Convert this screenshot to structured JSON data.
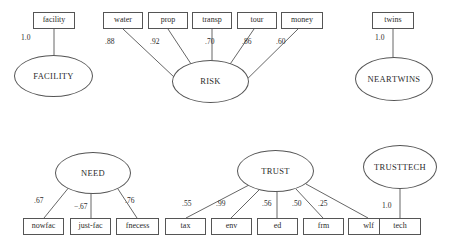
{
  "diagram": {
    "type": "path-diagram",
    "background_color": "#ffffff",
    "stroke_color": "#555555",
    "text_color": "#2b2b2b",
    "models": [
      {
        "id": "facility",
        "latent": {
          "label": "FACILITY",
          "x": 14,
          "y": 55,
          "w": 79,
          "h": 42
        },
        "indicators": [
          {
            "label": "facility",
            "coefficient": "1.0",
            "x": 33,
            "y": 12,
            "w": 42,
            "h": 17,
            "coef_x": 21,
            "coef_y": 33
          }
        ]
      },
      {
        "id": "risk",
        "latent": {
          "label": "RISK",
          "x": 172,
          "y": 60,
          "w": 77,
          "h": 43
        },
        "indicators": [
          {
            "label": "water",
            "coefficient": ".88",
            "x": 103,
            "y": 12,
            "w": 40,
            "h": 17,
            "coef_x": 105,
            "coef_y": 37
          },
          {
            "label": "prop",
            "coefficient": ".92",
            "x": 148,
            "y": 12,
            "w": 40,
            "h": 17,
            "coef_x": 150,
            "coef_y": 37
          },
          {
            "label": "transp",
            "coefficient": ".70",
            "x": 192,
            "y": 12,
            "w": 40,
            "h": 17,
            "coef_x": 205,
            "coef_y": 37
          },
          {
            "label": "tour",
            "coefficient": ".86",
            "x": 237,
            "y": 12,
            "w": 40,
            "h": 17,
            "coef_x": 242,
            "coef_y": 37
          },
          {
            "label": "money",
            "coefficient": ".60",
            "x": 281,
            "y": 12,
            "w": 42,
            "h": 17,
            "coef_x": 276,
            "coef_y": 37
          }
        ]
      },
      {
        "id": "near-twins",
        "latent": {
          "label": "NEAR\nTWINS",
          "x": 355,
          "y": 57,
          "w": 78,
          "h": 44
        },
        "indicators": [
          {
            "label": "twins",
            "coefficient": "1.0",
            "x": 372,
            "y": 12,
            "w": 42,
            "h": 17,
            "coef_x": 375,
            "coef_y": 33
          }
        ]
      },
      {
        "id": "need",
        "latent": {
          "label": "NEED",
          "x": 55,
          "y": 152,
          "w": 76,
          "h": 42
        },
        "indicators": [
          {
            "label": "nowfac",
            "coefficient": ".67",
            "x": 23,
            "y": 218,
            "w": 41,
            "h": 17,
            "coef_x": 34,
            "coef_y": 196
          },
          {
            "label": "just-fac",
            "coefficient": "−.67",
            "x": 70,
            "y": 218,
            "w": 41,
            "h": 17,
            "coef_x": 74,
            "coef_y": 202
          },
          {
            "label": "fnecess",
            "coefficient": ".76",
            "x": 116,
            "y": 218,
            "w": 43,
            "h": 17,
            "coef_x": 125,
            "coef_y": 196
          }
        ]
      },
      {
        "id": "trust",
        "latent": {
          "label": "TRUST",
          "x": 237,
          "y": 150,
          "w": 77,
          "h": 42
        },
        "indicators": [
          {
            "label": "tax",
            "coefficient": ".55",
            "x": 165,
            "y": 218,
            "w": 41,
            "h": 17,
            "coef_x": 182,
            "coef_y": 199
          },
          {
            "label": "env",
            "coefficient": ".99",
            "x": 211,
            "y": 218,
            "w": 41,
            "h": 17,
            "coef_x": 216,
            "coef_y": 199
          },
          {
            "label": "ed",
            "coefficient": ".56",
            "x": 257,
            "y": 218,
            "w": 41,
            "h": 17,
            "coef_x": 262,
            "coef_y": 199
          },
          {
            "label": "frm",
            "coefficient": ".50",
            "x": 303,
            "y": 218,
            "w": 41,
            "h": 17,
            "coef_x": 292,
            "coef_y": 199
          },
          {
            "label": "wlf",
            "coefficient": ".25",
            "x": 348,
            "y": 218,
            "w": 41,
            "h": 17,
            "coef_x": 318,
            "coef_y": 199
          }
        ]
      },
      {
        "id": "trust-tech",
        "latent": {
          "label": "TRUST\nTECH",
          "x": 363,
          "y": 145,
          "w": 74,
          "h": 44
        },
        "indicators": [
          {
            "label": "tech",
            "coefficient": "1.0",
            "x": 379,
            "y": 218,
            "w": 42,
            "h": 17,
            "coef_x": 382,
            "coef_y": 201
          }
        ]
      }
    ],
    "edges": [
      {
        "name": "facility-to-FACILITY",
        "x1": 54,
        "y1": 29,
        "x2": 54,
        "y2": 55
      },
      {
        "name": "water-to-RISK",
        "x1": 123,
        "y1": 29,
        "x2": 191,
        "y2": 93
      },
      {
        "name": "prop-to-RISK",
        "x1": 168,
        "y1": 29,
        "x2": 199,
        "y2": 76
      },
      {
        "name": "transp-to-RISK",
        "x1": 212,
        "y1": 29,
        "x2": 212,
        "y2": 61
      },
      {
        "name": "tour-to-RISK",
        "x1": 254,
        "y1": 29,
        "x2": 222,
        "y2": 76
      },
      {
        "name": "money-to-RISK",
        "x1": 298,
        "y1": 29,
        "x2": 231,
        "y2": 95
      },
      {
        "name": "twins-to-NEARTWINS",
        "x1": 393,
        "y1": 29,
        "x2": 393,
        "y2": 57
      },
      {
        "name": "NEED-to-nowfac",
        "x1": 70,
        "y1": 186,
        "x2": 44,
        "y2": 218
      },
      {
        "name": "NEED-to-just-fac",
        "x1": 91,
        "y1": 194,
        "x2": 91,
        "y2": 218
      },
      {
        "name": "NEED-to-fnecess",
        "x1": 116,
        "y1": 186,
        "x2": 137,
        "y2": 218
      },
      {
        "name": "TRUST-to-tax",
        "x1": 249,
        "y1": 185,
        "x2": 186,
        "y2": 218
      },
      {
        "name": "TRUST-to-env",
        "x1": 259,
        "y1": 190,
        "x2": 231,
        "y2": 218
      },
      {
        "name": "TRUST-to-ed",
        "x1": 277,
        "y1": 192,
        "x2": 277,
        "y2": 218
      },
      {
        "name": "TRUST-to-frm",
        "x1": 296,
        "y1": 189,
        "x2": 323,
        "y2": 218
      },
      {
        "name": "TRUST-to-wlf",
        "x1": 306,
        "y1": 184,
        "x2": 368,
        "y2": 218
      },
      {
        "name": "TRUSTTECH-to-tech",
        "x1": 400,
        "y1": 189,
        "x2": 400,
        "y2": 218
      }
    ]
  }
}
